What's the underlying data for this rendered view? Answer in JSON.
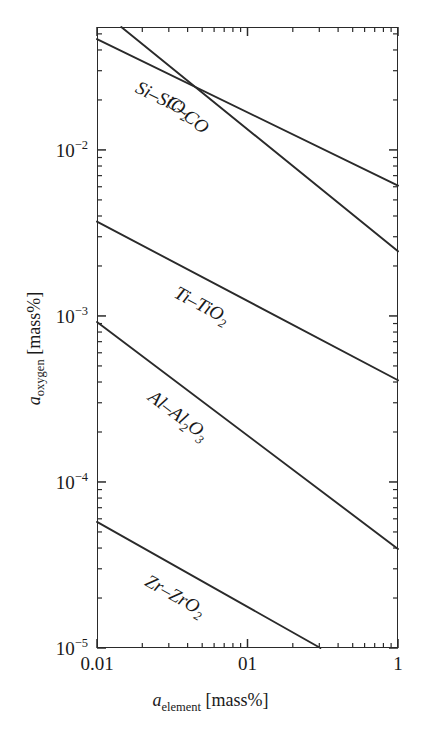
{
  "chart_data": {
    "type": "line",
    "title": "",
    "xlabel": "a_element [mass%]",
    "ylabel": "a_oxygen [mass%]",
    "xscale": "log",
    "yscale": "log",
    "xlim": [
      0.01,
      1
    ],
    "ylim": [
      1e-05,
      0.055
    ],
    "grid": false,
    "legend": "inline-curve-labels",
    "x_tick_labels": [
      "0.01",
      "01",
      "1"
    ],
    "x_tick_values": [
      0.01,
      0.1,
      1
    ],
    "y_tick_labels": [
      "10⁻²",
      "10⁻³",
      "10⁻⁴",
      "10⁻⁵"
    ],
    "y_tick_values": [
      0.01,
      0.001,
      0.0001,
      1e-05
    ],
    "series": [
      {
        "name": "C-CO",
        "label_html": "C–CO",
        "x": [
          0.0145,
          1.0
        ],
        "y": [
          0.055,
          0.00245
        ]
      },
      {
        "name": "Si-SiO2",
        "label_html": "Si–SiO<sub>2</sub>",
        "x": [
          0.01,
          1.0
        ],
        "y": [
          0.0465,
          0.0061
        ]
      },
      {
        "name": "Ti-TiO2",
        "label_html": "Ti–TiO<sub>2</sub>",
        "x": [
          0.01,
          1.0
        ],
        "y": [
          0.0037,
          0.00041
        ]
      },
      {
        "name": "Al-Al2O3",
        "label_html": "Al–Al<sub>2</sub>O<sub>3</sub>",
        "x": [
          0.01,
          1.0
        ],
        "y": [
          0.00092,
          3.95e-05
        ]
      },
      {
        "name": "Zr-ZrO2",
        "label_html": "Zr–ZrO<sub>2</sub>",
        "x": [
          0.01,
          0.305
        ],
        "y": [
          5.75e-05,
          1e-05
        ]
      }
    ]
  },
  "axes": {
    "y_ticks": [
      {
        "label_base": "10",
        "label_exp": "−2"
      },
      {
        "label_base": "10",
        "label_exp": "−3"
      },
      {
        "label_base": "10",
        "label_exp": "−4"
      },
      {
        "label_base": "10",
        "label_exp": "−5"
      }
    ],
    "x_ticks": [
      {
        "label": "0.01"
      },
      {
        "label": "01"
      },
      {
        "label": "1"
      }
    ],
    "x_title": {
      "var": "a",
      "sub": "element",
      "unit": "[mass%]"
    },
    "y_title": {
      "var": "a",
      "sub": "oxygen",
      "unit": "[mass%]"
    }
  },
  "curve_labels": [
    {
      "name": "C-CO",
      "pre": "C–CO",
      "sub": "",
      "post": ""
    },
    {
      "name": "Si-SiO2",
      "pre": "Si–SiO",
      "sub": "2",
      "post": ""
    },
    {
      "name": "Ti-TiO2",
      "pre": "Ti–TiO",
      "sub": "2",
      "post": ""
    },
    {
      "name": "Al-Al2O3",
      "pre": "Al–Al",
      "sub": "2",
      "post": "O",
      "sub2": "3"
    },
    {
      "name": "Zr-ZrO2",
      "pre": "Zr–ZrO",
      "sub": "2",
      "post": ""
    }
  ],
  "colors": {
    "line": "#2a2a2a",
    "frame": "#2a2a2a",
    "text": "#1a1a1a",
    "background": "#ffffff"
  }
}
